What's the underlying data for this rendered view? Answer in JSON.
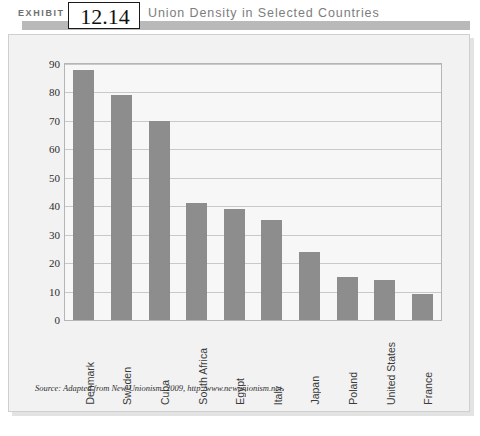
{
  "header": {
    "exhibit_label": "EXHIBIT",
    "exhibit_number": "12.14",
    "title": "Union Density in Selected Countries"
  },
  "source_note": "Source: Adapted from New Unionism. 2009, http:/www.newunionism.net.",
  "colors": {
    "bar": "#8d8d8d",
    "panel_background": "#f2f2f2",
    "plot_background": "#f7f7f7",
    "gridline": "#c9c9c9",
    "header_band": "#b9b9b9",
    "title_text": "#7d7d7d"
  },
  "chart_data": {
    "type": "bar",
    "title": "Union Density in Selected Countries",
    "xlabel": "",
    "ylabel": "",
    "ylim": [
      0,
      90
    ],
    "yticks": [
      0,
      10,
      20,
      30,
      40,
      50,
      60,
      70,
      80,
      90
    ],
    "grid": true,
    "legend": null,
    "categories": [
      "Denmark",
      "Sweden",
      "Cuba",
      "South Africa",
      "Egypt",
      "Italy",
      "Japan",
      "Poland",
      "United States",
      "France"
    ],
    "values": [
      88,
      79,
      70,
      41,
      39,
      35,
      24,
      15,
      14,
      9
    ]
  }
}
